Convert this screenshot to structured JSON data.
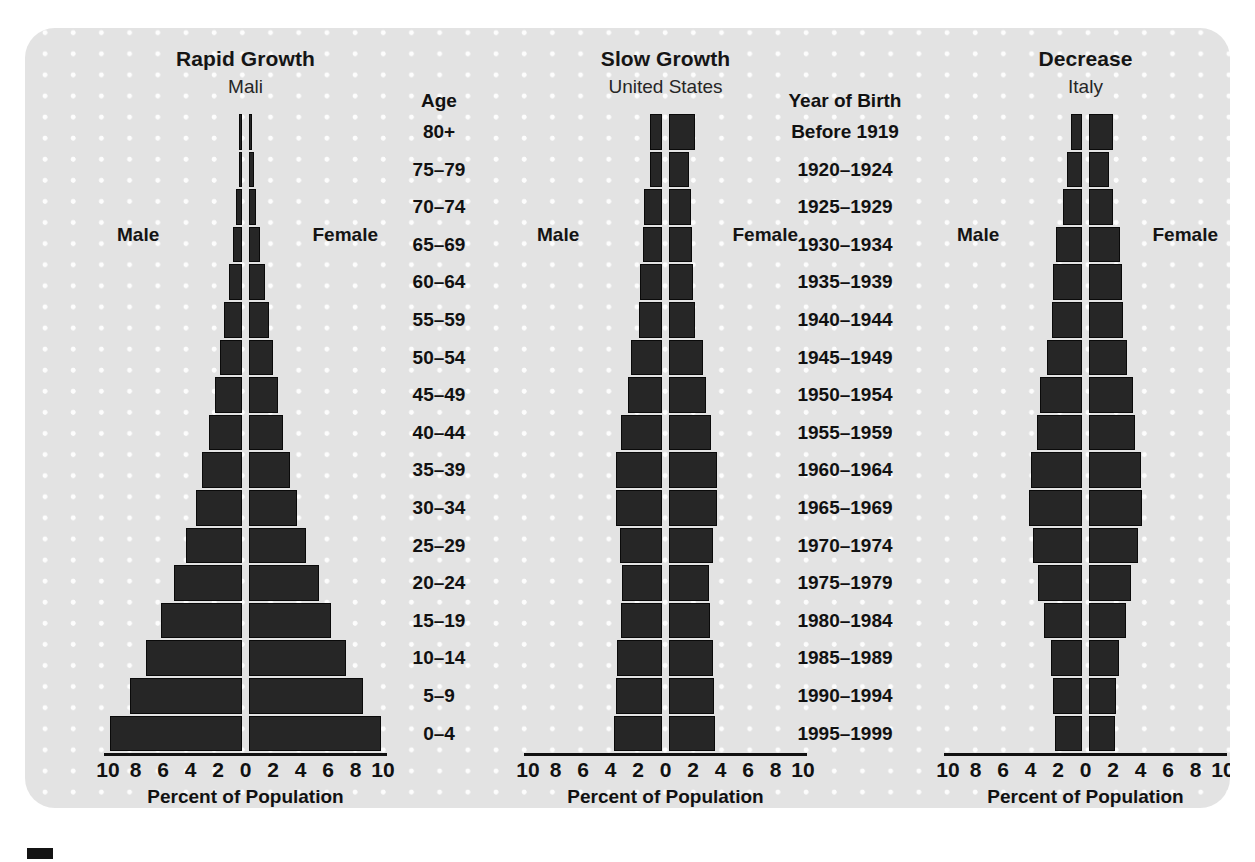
{
  "axis": {
    "ticks": [
      "10",
      "8",
      "6",
      "4",
      "2",
      "0",
      "2",
      "4",
      "6",
      "8",
      "10"
    ],
    "caption": "Percent of Population"
  },
  "legend": {
    "male": "Male",
    "female": "Female"
  },
  "age_column": {
    "header": "Age",
    "items": [
      "80+",
      "75–79",
      "70–74",
      "65–69",
      "60–64",
      "55–59",
      "50–54",
      "45–49",
      "40–44",
      "35–39",
      "30–34",
      "25–29",
      "20–24",
      "15–19",
      "10–14",
      "5–9",
      "0–4"
    ]
  },
  "year_column": {
    "header": "Year of Birth",
    "items": [
      "Before 1919",
      "1920–1924",
      "1925–1929",
      "1930–1934",
      "1935–1939",
      "1940–1944",
      "1945–1949",
      "1950–1954",
      "1955–1959",
      "1960–1964",
      "1965–1969",
      "1970–1974",
      "1975–1979",
      "1980–1984",
      "1985–1989",
      "1990–1994",
      "1995–1999"
    ]
  },
  "panels": [
    {
      "title": "Rapid Growth",
      "subtitle": "Mali"
    },
    {
      "title": "Slow Growth",
      "subtitle": "United States"
    },
    {
      "title": "Decrease",
      "subtitle": "Italy"
    }
  ],
  "colors": {
    "background": "#ffffff",
    "panel": "#e3e3e3",
    "dots": "#fdfdfd",
    "bar": "#262626",
    "bar_border": "#0a0a0a",
    "text": "#111111"
  },
  "chart_data": [
    {
      "type": "bar",
      "title": "Rapid Growth",
      "subtitle": "Mali",
      "xlabel": "Percent of Population",
      "ylabel": "Age",
      "xlim": [
        -10,
        10
      ],
      "xticks": [
        10,
        8,
        6,
        4,
        2,
        0,
        2,
        4,
        6,
        8,
        10
      ],
      "grid": false,
      "legend": [
        "Male",
        "Female"
      ],
      "categories": [
        "80+",
        "75–79",
        "70–74",
        "65–69",
        "60–64",
        "55–59",
        "50–54",
        "45–49",
        "40–44",
        "35–39",
        "30–34",
        "25–29",
        "20–24",
        "15–19",
        "10–14",
        "5–9",
        "0–4"
      ],
      "series": [
        {
          "name": "Male",
          "values": [
            0.15,
            0.25,
            0.45,
            0.7,
            1.0,
            1.3,
            1.6,
            2.0,
            2.4,
            2.9,
            3.4,
            4.1,
            5.0,
            5.9,
            7.0,
            8.2,
            9.6
          ]
        },
        {
          "name": "Female",
          "values": [
            0.2,
            0.35,
            0.55,
            0.85,
            1.15,
            1.45,
            1.75,
            2.1,
            2.5,
            3.0,
            3.5,
            4.2,
            5.1,
            6.0,
            7.1,
            8.3,
            9.6
          ]
        }
      ]
    },
    {
      "type": "bar",
      "title": "Slow Growth",
      "subtitle": "United States",
      "xlabel": "Percent of Population",
      "ylabel": "Year of Birth",
      "xlim": [
        -10,
        10
      ],
      "xticks": [
        10,
        8,
        6,
        4,
        2,
        0,
        2,
        4,
        6,
        8,
        10
      ],
      "grid": false,
      "legend": [
        "Male",
        "Female"
      ],
      "categories": [
        "Before 1919",
        "1920–1924",
        "1925–1929",
        "1930–1934",
        "1935–1939",
        "1940–1944",
        "1945–1949",
        "1950–1954",
        "1955–1959",
        "1960–1964",
        "1965–1969",
        "1970–1974",
        "1975–1979",
        "1980–1984",
        "1985–1989",
        "1990–1994",
        "1995–1999"
      ],
      "series": [
        {
          "name": "Male",
          "values": [
            0.9,
            0.9,
            1.3,
            1.4,
            1.6,
            1.7,
            2.3,
            2.5,
            3.0,
            3.4,
            3.4,
            3.1,
            2.9,
            3.0,
            3.3,
            3.4,
            3.5
          ]
        },
        {
          "name": "Female",
          "values": [
            1.9,
            1.5,
            1.6,
            1.7,
            1.8,
            1.9,
            2.5,
            2.7,
            3.1,
            3.5,
            3.5,
            3.2,
            2.9,
            3.0,
            3.2,
            3.3,
            3.4
          ]
        }
      ]
    },
    {
      "type": "bar",
      "title": "Decrease",
      "subtitle": "Italy",
      "xlabel": "Percent of Population",
      "ylabel": "Year of Birth",
      "xlim": [
        -10,
        10
      ],
      "xticks": [
        10,
        8,
        6,
        4,
        2,
        0,
        2,
        4,
        6,
        8,
        10
      ],
      "grid": false,
      "legend": [
        "Male",
        "Female"
      ],
      "categories": [
        "Before 1919",
        "1920–1924",
        "1925–1929",
        "1930–1934",
        "1935–1939",
        "1940–1944",
        "1945–1949",
        "1950–1954",
        "1955–1959",
        "1960–1964",
        "1965–1969",
        "1970–1974",
        "1975–1979",
        "1980–1984",
        "1985–1989",
        "1990–1994",
        "1995–1999"
      ],
      "series": [
        {
          "name": "Male",
          "values": [
            0.8,
            1.1,
            1.4,
            1.9,
            2.1,
            2.2,
            2.6,
            3.1,
            3.3,
            3.7,
            3.9,
            3.6,
            3.2,
            2.8,
            2.3,
            2.1,
            2.0
          ]
        },
        {
          "name": "Female",
          "values": [
            1.8,
            1.5,
            1.8,
            2.3,
            2.4,
            2.5,
            2.8,
            3.2,
            3.4,
            3.8,
            3.9,
            3.6,
            3.1,
            2.7,
            2.2,
            2.0,
            1.9
          ]
        }
      ]
    }
  ]
}
